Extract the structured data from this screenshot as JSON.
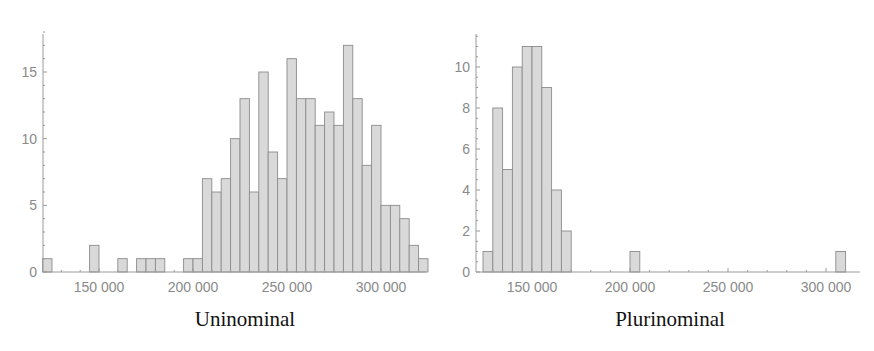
{
  "chart_data": [
    {
      "type": "bar",
      "title": "Uninominal",
      "xlabel": "",
      "ylabel": "",
      "bin_width": 5000,
      "xlim": [
        116000,
        326000
      ],
      "ylim": [
        0,
        18
      ],
      "x_ticks": [
        150000,
        200000,
        250000,
        300000
      ],
      "x_tick_labels": [
        "150 000",
        "200 000",
        "250 000",
        "300 000"
      ],
      "y_ticks": [
        0,
        5,
        10,
        15
      ],
      "bin_starts": [
        120000,
        145000,
        160000,
        170000,
        175000,
        180000,
        195000,
        200000,
        205000,
        210000,
        215000,
        220000,
        225000,
        230000,
        235000,
        240000,
        245000,
        250000,
        255000,
        260000,
        265000,
        270000,
        275000,
        280000,
        285000,
        290000,
        295000,
        300000,
        305000,
        310000,
        315000,
        320000
      ],
      "values": [
        1,
        2,
        1,
        1,
        1,
        1,
        1,
        1,
        7,
        6,
        7,
        10,
        13,
        6,
        15,
        9,
        7,
        16,
        13,
        13,
        11,
        12,
        11,
        17,
        13,
        8,
        11,
        5,
        5,
        4,
        2,
        1
      ],
      "grid": false
    },
    {
      "type": "bar",
      "title": "Plurinominal",
      "xlabel": "",
      "ylabel": "",
      "bin_width": 5000,
      "xlim": [
        124000,
        312000
      ],
      "ylim": [
        0,
        11.5
      ],
      "x_ticks": [
        150000,
        200000,
        250000,
        300000
      ],
      "x_tick_labels": [
        "150 000",
        "200 000",
        "250 000",
        "300 000"
      ],
      "y_ticks": [
        0,
        2,
        4,
        6,
        8,
        10
      ],
      "bin_starts": [
        125000,
        130000,
        135000,
        140000,
        145000,
        150000,
        155000,
        160000,
        165000,
        200000,
        305000
      ],
      "values": [
        1,
        8,
        5,
        10,
        11,
        11,
        9,
        4,
        2,
        1,
        1
      ],
      "grid": false
    }
  ],
  "titles": {
    "left": "Uninominal",
    "right": "Plurinominal"
  }
}
